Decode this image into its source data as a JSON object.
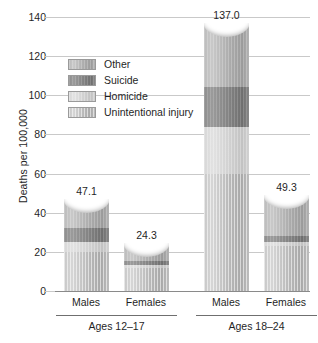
{
  "chart_data": {
    "type": "bar",
    "subtype": "stacked-column",
    "title": "",
    "xlabel": "",
    "ylabel": "Deaths per 100,000",
    "ylim": [
      0,
      140
    ],
    "yticks": [
      0,
      20,
      40,
      60,
      80,
      100,
      120,
      140
    ],
    "grid": true,
    "legend_position": "inside-upper-left",
    "categories": [
      "Males",
      "Females",
      "Males",
      "Females"
    ],
    "groups": [
      {
        "label": "Ages 12–17",
        "categories": [
          "Males",
          "Females"
        ]
      },
      {
        "label": "Ages 18–24",
        "categories": [
          "Males",
          "Females"
        ]
      }
    ],
    "series": [
      {
        "name": "Unintentional injury",
        "values": [
          20.0,
          12.0,
          60.0,
          23.0
        ],
        "color": "#bcbcbc"
      },
      {
        "name": "Homicide",
        "values": [
          5.0,
          1.5,
          24.0,
          2.0
        ],
        "color": "#d4d4d4"
      },
      {
        "name": "Suicide",
        "values": [
          7.0,
          2.0,
          20.0,
          3.0
        ],
        "color": "#868686"
      },
      {
        "name": "Other",
        "values": [
          15.1,
          8.8,
          33.0,
          21.3
        ],
        "color": "#b4b4b4"
      }
    ],
    "totals": [
      47.1,
      24.3,
      137.0,
      49.3
    ],
    "data_labels": [
      "47.1",
      "24.3",
      "137.0",
      "49.3"
    ],
    "tick_labels": [
      "0",
      "20",
      "40",
      "60",
      "80",
      "100",
      "120",
      "140"
    ]
  },
  "legend": {
    "items": [
      {
        "label": "Other"
      },
      {
        "label": "Suicide"
      },
      {
        "label": "Homicide"
      },
      {
        "label": "Unintentional injury"
      }
    ]
  },
  "axis": {
    "y_title": "Deaths per 100,000"
  }
}
